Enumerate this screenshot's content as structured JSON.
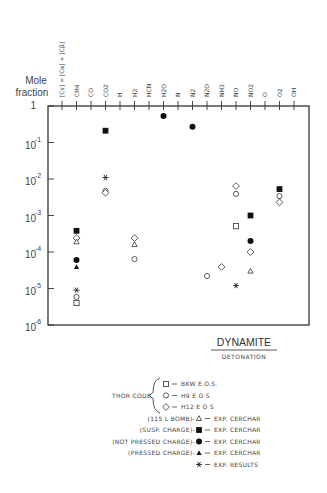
{
  "chart_data": {
    "type": "scatter",
    "title": "DYNAMITE",
    "subtitle": "DETONATION",
    "ylabel": "Mole fraction",
    "yscale": "log",
    "ylim": [
      1e-06,
      1
    ],
    "yticks": [
      {
        "value": 1,
        "label": "1"
      },
      {
        "value": 0.1,
        "base": "10",
        "exp": "-1"
      },
      {
        "value": 0.01,
        "base": "10",
        "exp": "-2"
      },
      {
        "value": 0.001,
        "base": "10",
        "exp": "-3"
      },
      {
        "value": 0.0001,
        "base": "10",
        "exp": "-4"
      },
      {
        "value": 1e-05,
        "base": "10",
        "exp": "-5"
      },
      {
        "value": 1e-06,
        "base": "10",
        "exp": "-6"
      }
    ],
    "categories": [
      "[Cs] = [Cα] + [Cβ]",
      "CH4",
      "CO",
      "CO2",
      "H",
      "H2",
      "HCN",
      "H2O",
      "N",
      "N2",
      "N2O",
      "NH3",
      "NO",
      "NO2",
      "O",
      "O2",
      "OH"
    ],
    "series": [
      {
        "name": "BKW EOS",
        "marker": "square-open",
        "points": [
          {
            "x": "CH4",
            "y": 4e-06
          },
          {
            "x": "NO",
            "y": 0.00051
          }
        ]
      },
      {
        "name": "H9 EOS",
        "marker": "circle-open",
        "points": [
          {
            "x": "CH4",
            "y": 5.9e-06
          },
          {
            "x": "CO2",
            "y": 0.0047
          },
          {
            "x": "H2",
            "y": 6.4e-05
          },
          {
            "x": "N2O",
            "y": 2.2e-05
          },
          {
            "x": "NO",
            "y": 0.0039
          },
          {
            "x": "O2",
            "y": 0.0034
          }
        ]
      },
      {
        "name": "H12 EOS",
        "marker": "diamond-open",
        "points": [
          {
            "x": "CH4",
            "y": 0.00024
          },
          {
            "x": "CO2",
            "y": 0.0042
          },
          {
            "x": "H2",
            "y": 0.00024
          },
          {
            "x": "NH3",
            "y": 3.9e-05
          },
          {
            "x": "NO",
            "y": 0.0064
          },
          {
            "x": "NO2",
            "y": 0.0001
          },
          {
            "x": "O2",
            "y": 0.0023
          }
        ]
      },
      {
        "name": "(115 L BOMB) EXP. CERCHAR",
        "marker": "triangle-open",
        "points": [
          {
            "x": "CH4",
            "y": 0.00019
          },
          {
            "x": "H2",
            "y": 0.00016
          },
          {
            "x": "NO2",
            "y": 3e-05
          }
        ]
      },
      {
        "name": "(SUSP. CHARGE) EXP. CERCHAR",
        "marker": "square-filled",
        "points": [
          {
            "x": "CH4",
            "y": 0.00038
          },
          {
            "x": "CO2",
            "y": 0.21
          },
          {
            "x": "NO2",
            "y": 0.001
          },
          {
            "x": "O2",
            "y": 0.0053
          }
        ]
      },
      {
        "name": "(NOT PRESSED CHARGE) EXP. CERCHAR",
        "marker": "circle-filled",
        "points": [
          {
            "x": "CH4",
            "y": 6e-05
          },
          {
            "x": "H2O",
            "y": 0.53
          },
          {
            "x": "N2",
            "y": 0.27
          },
          {
            "x": "NO2",
            "y": 0.0002
          }
        ]
      },
      {
        "name": "(PRESSED CHARGE) EXP. CERCHAR",
        "marker": "triangle-filled",
        "points": [
          {
            "x": "CH4",
            "y": 3.9e-05
          }
        ]
      },
      {
        "name": "EXP. RESULTS",
        "marker": "asterisk",
        "points": [
          {
            "x": "CH4",
            "y": 9e-06
          },
          {
            "x": "CO2",
            "y": 0.011
          },
          {
            "x": "NO",
            "y": 1.2e-05
          }
        ]
      }
    ],
    "legend": {
      "placement": "bottom-right",
      "group_label": "THOR CODE",
      "entries": [
        {
          "prefix": "",
          "marker": "square-open",
          "text": "BKW    E.O.S."
        },
        {
          "prefix": "",
          "marker": "circle-open",
          "text": "H9      E O S"
        },
        {
          "prefix": "",
          "marker": "diamond-open",
          "text": "H12    E O S"
        },
        {
          "prefix": "(115 L BOMB)-",
          "marker": "triangle-open",
          "text": "EXP. CERCHAR"
        },
        {
          "prefix": "(SUSP. CHARGE)-",
          "marker": "square-filled",
          "text": "EXP. CERCHAR"
        },
        {
          "prefix": "(NOT PRESSED CHARGE)-",
          "marker": "circle-filled",
          "text": "EXP. CERCHAR"
        },
        {
          "prefix": "(PRESSED CHARGE)-",
          "marker": "triangle-filled",
          "text": "EXP. CERCHAR"
        },
        {
          "prefix": "",
          "marker": "asterisk",
          "text": "EXP. RESULTS"
        }
      ]
    },
    "grid": false
  },
  "ylabel_lines": [
    "Mole",
    "fraction"
  ]
}
